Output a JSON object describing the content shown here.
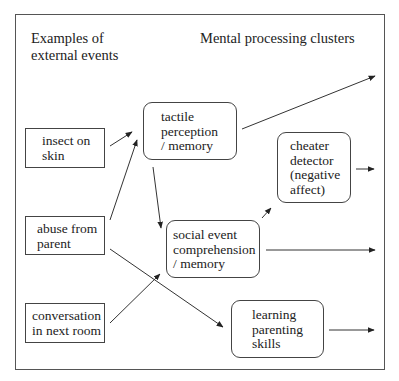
{
  "headings": {
    "left": "Examples of\nexternal events",
    "right": "Mental processing clusters"
  },
  "events": [
    {
      "id": "insect",
      "label": "insect on\nskin"
    },
    {
      "id": "abuse",
      "label": "abuse from\nparent"
    },
    {
      "id": "conversation",
      "label": "conversation\nin next room"
    }
  ],
  "clusters": [
    {
      "id": "tactile",
      "label": "tactile\nperception\n/ memory"
    },
    {
      "id": "cheater",
      "label": "cheater\ndetector\n(negative\naffect)"
    },
    {
      "id": "social",
      "label": "social event\ncomprehension\n/ memory"
    },
    {
      "id": "learning",
      "label": "learning\nparenting\nskills"
    }
  ],
  "connections": [
    {
      "from": "insect",
      "to": "tactile"
    },
    {
      "from": "abuse",
      "to": "tactile"
    },
    {
      "from": "abuse",
      "to": "learning"
    },
    {
      "from": "conversation",
      "to": "social"
    },
    {
      "from": "tactile",
      "to": "social"
    },
    {
      "from": "tactile",
      "to": "output"
    },
    {
      "from": "social",
      "to": "cheater"
    },
    {
      "from": "social",
      "to": "output"
    },
    {
      "from": "cheater",
      "to": "output"
    },
    {
      "from": "learning",
      "to": "output"
    }
  ]
}
